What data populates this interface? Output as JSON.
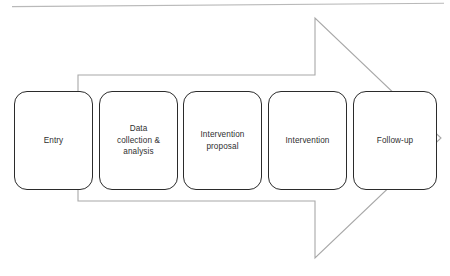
{
  "diagram": {
    "type": "process-flow-arrow",
    "direction": "left-to-right",
    "arrow": {
      "name": "pentagon-arrow-shape",
      "fill": "#ffffff",
      "stroke": "#a8a8a8",
      "stroke_width": 1,
      "tail_left_x": 78,
      "tail_top_y": 75,
      "tail_bottom_y": 201,
      "head_notch_x": 315,
      "head_top_y": 18,
      "head_bottom_y": 258,
      "tip_x": 441,
      "tip_y": 138
    },
    "top_rule": {
      "name": "page-edge-rule",
      "color": "#b9b9b9",
      "left_y": 7,
      "right_y": 3
    },
    "box_style": {
      "fill": "#ffffff",
      "stroke": "#2b2b2b",
      "text_color": "#2f2f2f",
      "corner_radius": 13
    },
    "steps": [
      {
        "id": "entry",
        "label": "Entry"
      },
      {
        "id": "data-collection",
        "label": "Data\ncollection &\nanalysis"
      },
      {
        "id": "intervention-proposal",
        "label": "Intervention\nproposal"
      },
      {
        "id": "intervention",
        "label": "Intervention"
      },
      {
        "id": "follow-up",
        "label": "Follow-up"
      }
    ]
  }
}
